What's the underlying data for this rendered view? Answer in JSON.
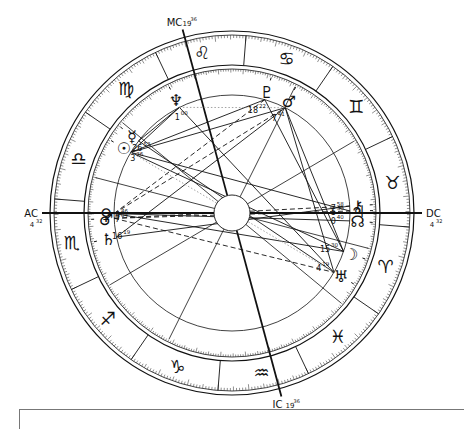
{
  "chart": {
    "angles": [
      {
        "key": "asc",
        "label": "AC",
        "degree": "4",
        "minute": "32",
        "lon": 214.53
      },
      {
        "key": "dsc",
        "label": "DC",
        "degree": "4",
        "minute": "32",
        "lon": 34.53
      },
      {
        "key": "mc",
        "label": "MC",
        "degree": "19",
        "minute": "36",
        "lon": 139.6
      },
      {
        "key": "ic",
        "label": "IC",
        "degree": "19",
        "minute": "36",
        "lon": 319.6
      }
    ],
    "signs": [
      {
        "name": "aries",
        "glyph": "♈"
      },
      {
        "name": "taurus",
        "glyph": "♉"
      },
      {
        "name": "gemini",
        "glyph": "♊"
      },
      {
        "name": "cancer",
        "glyph": "♋"
      },
      {
        "name": "leo",
        "glyph": "♌"
      },
      {
        "name": "virgo",
        "glyph": "♍"
      },
      {
        "name": "libra",
        "glyph": "♎"
      },
      {
        "name": "scorpio",
        "glyph": "♏"
      },
      {
        "name": "sagittarius",
        "glyph": "♐"
      },
      {
        "name": "capricorn",
        "glyph": "♑"
      },
      {
        "name": "aquarius",
        "glyph": "♒"
      },
      {
        "name": "pisces",
        "glyph": "♓"
      }
    ],
    "house_cusps": [
      214.53,
      245,
      278,
      319.6,
      355,
      20,
      34.53,
      65,
      98,
      139.6,
      175,
      200
    ],
    "planets": [
      {
        "name": "sun",
        "glyph": "☉",
        "degree": "3",
        "minute": "36",
        "lon": 183.6
      },
      {
        "name": "moon",
        "glyph": "☽",
        "degree": "15",
        "minute": "30",
        "lon": 15.5
      },
      {
        "name": "mercury",
        "glyph": "☿",
        "degree": "26",
        "minute": "53",
        "lon": 176.9,
        "retro": true
      },
      {
        "name": "venus",
        "glyph": "♀",
        "degree": "4",
        "minute": "46",
        "lon": 214.8
      },
      {
        "name": "mars",
        "glyph": "♂",
        "degree": "7",
        "minute": "04",
        "lon": 217.1
      },
      {
        "name": "jupiter",
        "glyph": "♃",
        "degree": "5",
        "minute": "33",
        "lon": 35.5
      },
      {
        "name": "saturn",
        "glyph": "♄",
        "degree": "16",
        "minute": "19",
        "lon": 226.3
      },
      {
        "name": "uranus",
        "glyph": "♅",
        "degree": "4",
        "minute": "19",
        "lon": 4.3
      },
      {
        "name": "neptune",
        "glyph": "♆",
        "degree": "1",
        "minute": "00",
        "lon": 151.0
      },
      {
        "name": "pluto",
        "glyph": "♇",
        "degree": "18",
        "minute": "22",
        "lon": 108.4
      },
      {
        "name": "chiron",
        "glyph": "⚷",
        "degree": "7",
        "minute": "58",
        "lon": 37.9
      },
      {
        "name": "lunar-node",
        "glyph": "☊",
        "degree": "0",
        "minute": "40",
        "lon": 30.7
      },
      {
        "name": "lilith",
        "glyph": "♂",
        "degree": "7",
        "minute": "41",
        "lon": 97.7
      }
    ],
    "aspects": [
      {
        "a": "sun",
        "b": "pluto",
        "style": "solid"
      },
      {
        "a": "sun",
        "b": "lilith",
        "style": "solid"
      },
      {
        "a": "sun",
        "b": "neptune",
        "style": "solid"
      },
      {
        "a": "sun",
        "b": "moon",
        "style": "solid"
      },
      {
        "a": "sun",
        "b": "jupiter",
        "style": "solid"
      },
      {
        "a": "mercury",
        "b": "neptune",
        "style": "solid"
      },
      {
        "a": "mercury",
        "b": "uranus",
        "style": "solid"
      },
      {
        "a": "venus",
        "b": "lunar-node",
        "style": "solid"
      },
      {
        "a": "venus",
        "b": "moon",
        "style": "solid"
      },
      {
        "a": "venus",
        "b": "lilith",
        "style": "dashed"
      },
      {
        "a": "mars",
        "b": "jupiter",
        "style": "dashed"
      },
      {
        "a": "mars",
        "b": "chiron",
        "style": "dashed"
      },
      {
        "a": "saturn",
        "b": "chiron",
        "style": "solid"
      },
      {
        "a": "saturn",
        "b": "lilith",
        "style": "solid"
      },
      {
        "a": "neptune",
        "b": "uranus",
        "style": "solid"
      },
      {
        "a": "pluto",
        "b": "moon",
        "style": "solid"
      },
      {
        "a": "lilith",
        "b": "moon",
        "style": "solid"
      },
      {
        "a": "lilith",
        "b": "uranus",
        "style": "solid"
      },
      {
        "a": "neptune",
        "b": "lilith",
        "style": "dotted"
      },
      {
        "a": "sun",
        "b": "uranus",
        "style": "dotted"
      },
      {
        "a": "mars",
        "b": "uranus",
        "style": "dashed"
      },
      {
        "a": "pluto",
        "b": "venus",
        "style": "dashed"
      }
    ],
    "colors": {
      "ink": "#111111",
      "thin": "#444444",
      "dotted": "#999999"
    }
  }
}
